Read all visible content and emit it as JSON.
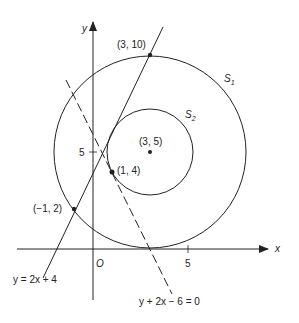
{
  "diagram": {
    "axes": {
      "x_label": "x",
      "y_label": "y",
      "origin_label": "O",
      "x_tick_label": "5",
      "y_tick_label": "5"
    },
    "circles": [
      {
        "name": "S1",
        "label_main": "S",
        "label_sub": "1",
        "center": [
          3,
          5
        ],
        "radius": 5
      },
      {
        "name": "S2",
        "label_main": "S",
        "label_sub": "2",
        "center": [
          3,
          5
        ],
        "radius": 2.236
      }
    ],
    "points": [
      {
        "label": "(3, 10)",
        "x": 3,
        "y": 10
      },
      {
        "label": "(3, 5)",
        "x": 3,
        "y": 5
      },
      {
        "label": "(1, 4)",
        "x": 1,
        "y": 4
      },
      {
        "label": "(−1, 2)",
        "x": -1,
        "y": 2
      }
    ],
    "lines": [
      {
        "equation": "y = 2x + 4",
        "style": "solid"
      },
      {
        "equation": "y + 2x − 6 = 0",
        "style": "dashed"
      }
    ],
    "colors": {
      "stroke": "#222222",
      "background": "#ffffff"
    }
  }
}
